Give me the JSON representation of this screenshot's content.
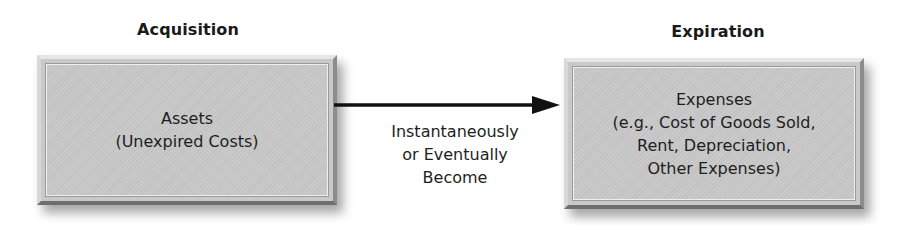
{
  "diagram": {
    "left": {
      "heading": "Acquisition",
      "box_lines": [
        "Assets",
        "(Unexpired Costs)"
      ]
    },
    "connector": {
      "label_lines": [
        "Instantaneously",
        "or Eventually",
        "Become"
      ],
      "direction": "left-to-right"
    },
    "right": {
      "heading": "Expiration",
      "box_lines": [
        "Expenses",
        "(e.g., Cost of Goods Sold,",
        "Rent, Depreciation,",
        "Other Expenses)"
      ]
    },
    "colors": {
      "box_fill": "#c8c8c8",
      "arrow": "#111111",
      "text": "#1e1e1e"
    }
  }
}
